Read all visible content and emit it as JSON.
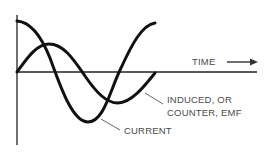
{
  "diagram": {
    "title": "",
    "axis_label": "TIME",
    "axis_arrow": "arrow-right",
    "curves": [
      {
        "name": "current",
        "label": "CURRENT",
        "shape": "cosine"
      },
      {
        "name": "induced_emf",
        "label_line1": "INDUCED, OR",
        "label_line2": "COUNTER, EMF",
        "shape": "sine (lags current)"
      }
    ],
    "labels": {
      "time": "TIME",
      "emf_line1": "INDUCED, OR",
      "emf_line2": "COUNTER, EMF",
      "current": "CURRENT"
    },
    "colors": {
      "stroke": "#111111",
      "text": "#4a4a4a",
      "background": "#ffffff"
    }
  }
}
